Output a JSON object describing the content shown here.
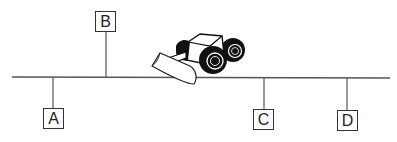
{
  "diagram": {
    "type": "road-with-points",
    "line_color": "#555555",
    "points": [
      {
        "label": "A",
        "side": "below"
      },
      {
        "label": "B",
        "side": "above"
      },
      {
        "label": "C",
        "side": "below"
      },
      {
        "label": "D",
        "side": "below"
      }
    ],
    "vehicle": {
      "icon": "bulldozer-icon"
    }
  }
}
